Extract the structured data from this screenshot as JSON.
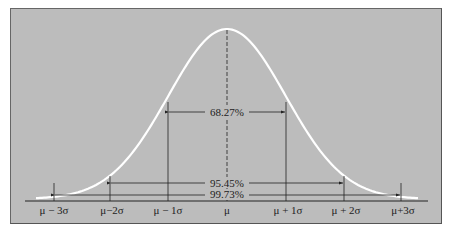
{
  "diagram": {
    "title": "",
    "type": "normal-distribution",
    "axis_labels": [
      "μ − 3σ",
      "μ−2σ",
      "μ − 1σ",
      "μ",
      "μ + 1σ",
      "μ + 2σ",
      "μ+3σ"
    ],
    "intervals": [
      {
        "label": "68.27%",
        "from": "μ − 1σ",
        "to": "μ + 1σ"
      },
      {
        "label": "95.45%",
        "from": "μ−2σ",
        "to": "μ + 2σ"
      },
      {
        "label": "99.73%",
        "from": "μ − 3σ",
        "to": "μ+3σ"
      }
    ],
    "colors": {
      "background": "#bcbcbc",
      "curve": "#ffffff",
      "lines": "#222222"
    }
  }
}
